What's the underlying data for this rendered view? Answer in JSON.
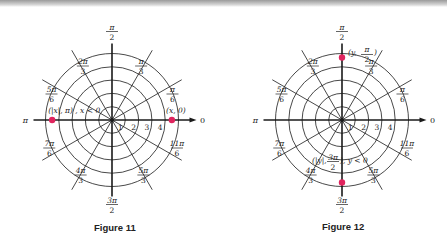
{
  "figures": [
    {
      "id": "fig11",
      "caption": "Figure 11",
      "center": [
        112,
        120
      ],
      "ring_spacing": 13.3,
      "rings": 5,
      "ring_labels": [
        "1",
        "2",
        "3",
        "4"
      ],
      "angle_labels": [
        {
          "num": "π",
          "den": "2",
          "deg": 90
        },
        {
          "num": "π",
          "den": "3",
          "deg": 60
        },
        {
          "num": "π",
          "den": "6",
          "deg": 30
        },
        {
          "text": "0",
          "deg": 0
        },
        {
          "num": "2π",
          "den": "3",
          "deg": 120
        },
        {
          "num": "5π",
          "den": "6",
          "deg": 150
        },
        {
          "text": "π",
          "deg": 180
        },
        {
          "num": "7π",
          "den": "6",
          "deg": 210
        },
        {
          "num": "4π",
          "den": "3",
          "deg": 240
        },
        {
          "num": "3π",
          "den": "2",
          "deg": 270
        },
        {
          "num": "5π",
          "den": "3",
          "deg": 300
        },
        {
          "num": "11π",
          "den": "6",
          "deg": 330
        }
      ],
      "points": [
        {
          "label": "(x, 0)",
          "r": 4.5,
          "deg": 0
        },
        {
          "label": "(|x|, π) ,  x < 0",
          "r": 4.5,
          "deg": 180
        }
      ]
    },
    {
      "id": "fig12",
      "caption": "Figure 12",
      "center": [
        342,
        120
      ],
      "ring_spacing": 13.3,
      "rings": 5,
      "ring_labels": [
        "1",
        "2",
        "3",
        "4"
      ],
      "points": [
        {
          "label_main": "(y, ",
          "label_frac_num": "π",
          "label_frac_den": "2",
          "label_tail": ")",
          "r": 4.7,
          "deg": 90
        },
        {
          "label_main": "(|y|, ",
          "label_frac_num": "3π",
          "label_frac_den": "2",
          "label_tail": "),  y < 0",
          "r": 4.7,
          "deg": 270
        }
      ]
    }
  ],
  "colors": {
    "line": "#1a1a1a",
    "point": "#e0245e"
  }
}
